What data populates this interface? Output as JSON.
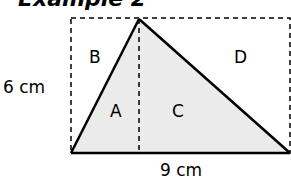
{
  "title": "Example 2",
  "labels": {
    "height": "6 cm",
    "base": "9 cm",
    "region_a": "A",
    "region_b": "B",
    "region_c": "C",
    "region_d": "D"
  },
  "colors": {
    "triangle_fill": "#ebebeb",
    "stroke": "#000000",
    "dashed": "#000000"
  }
}
